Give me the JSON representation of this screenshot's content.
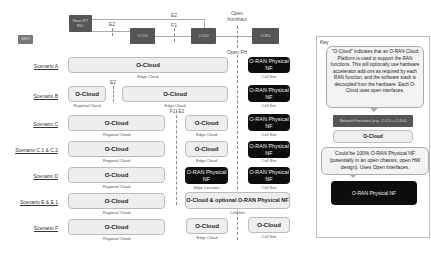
{
  "top_diagram": {
    "smo_label": "SMO",
    "nonrt_label": "Near-RT RIC",
    "ocu_label": "O-CU",
    "odu_label": "O-DU",
    "oru_label": "O-RU",
    "e2_left": "E2",
    "e2_top": "E2",
    "f1": "F1",
    "open_fronthaul": "Open fronthaul",
    "open_fh": "Open FH"
  },
  "scenarios": [
    {
      "name": "Scenario A",
      "boxes": [
        {
          "text": "O-Cloud",
          "caption": "Edge Cloud"
        },
        {
          "text": "O-RAN Physical NF",
          "caption": "Cell Site"
        }
      ]
    },
    {
      "name": "Scenario B",
      "boxes": [
        {
          "text": "O-Cloud",
          "caption": "Regional Cloud"
        },
        {
          "text": "O-Cloud",
          "caption": "Edge Cloud"
        },
        {
          "text": "O-RAN Physical NF",
          "caption": "Cell Site"
        }
      ],
      "interface": "E2"
    },
    {
      "name": "Scenario C",
      "boxes": [
        {
          "text": "O-Cloud",
          "caption": "Regional Cloud"
        },
        {
          "text": "O-Cloud",
          "caption": "Edge Cloud"
        },
        {
          "text": "O-RAN Physical NF",
          "caption": "Cell Site"
        }
      ],
      "interface": "F1, E2"
    },
    {
      "name": "Scenario C.1 & C.2",
      "boxes": [
        {
          "text": "O-Cloud",
          "caption": "Regional Cloud"
        },
        {
          "text": "O-Cloud",
          "caption": "Edge Cloud"
        },
        {
          "text": "O-RAN Physical NF",
          "caption": "Cell Site"
        }
      ]
    },
    {
      "name": "Scenario D",
      "boxes": [
        {
          "text": "O-Cloud",
          "caption": "Regional Cloud"
        },
        {
          "text": "O-RAN Physical NF",
          "caption": "Edge Location"
        },
        {
          "text": "O-RAN Physical NF",
          "caption": "Cell Site"
        }
      ]
    },
    {
      "name": "Scenario E & E.1",
      "boxes": [
        {
          "text": "O-Cloud",
          "caption": "Regional Cloud"
        },
        {
          "text": "O-Cloud & optional O-RAN Physical NF",
          "caption": "Cell Site"
        }
      ]
    },
    {
      "name": "Scenario F",
      "boxes": [
        {
          "text": "O-Cloud",
          "caption": "Regional Cloud"
        },
        {
          "text": "O-Cloud",
          "caption": "Edge Cloud"
        },
        {
          "text": "O-Cloud",
          "caption": "Cell Site"
        }
      ]
    }
  ],
  "key": {
    "title": "Key",
    "ocloud_desc": "\"O-Cloud\" indicates that an O-RAN Cloud Platform is used to support the RAN functions. This will optionally use hardware accelerator add-ons as required by each RAN function, and the software stack is decoupled from the hardware. Each O-Cloud uses open interfaces.",
    "network_function": "Network Functions (e.g., O-CU + O-DU)",
    "ocloud_box": "O-Cloud",
    "physical_desc": "Could be 100% O-RAN Physical NF (potentially in an open chassis, open HW design). Uses Open interfaces.",
    "physical_box": "O-RAN Physical NF"
  }
}
